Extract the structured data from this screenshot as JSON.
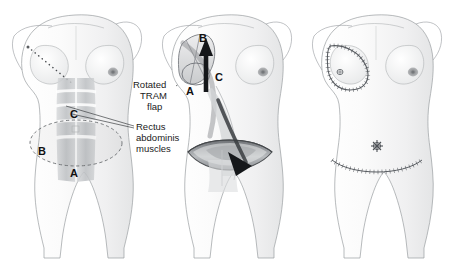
{
  "figure": {
    "background_color": "#ffffff",
    "width": 456,
    "height": 260,
    "panel_count": 3
  },
  "annotations": {
    "rotated_line1": "Rotated",
    "rotated_line2": "TRAM",
    "rotated_line3": "flap",
    "rectus_line1": "Rectus",
    "rectus_line2": "abdominis",
    "rectus_line3": "muscles"
  },
  "markers": {
    "left_a": "A",
    "left_b": "B",
    "left_c": "C",
    "mid_a": "A",
    "mid_b": "B",
    "mid_c": "C"
  },
  "panels": [
    {
      "id": "panel-preop",
      "name": "preoperative-planning",
      "features": [
        "dotted mastectomy incision line on right chest",
        "dashed elliptical abdominal flap outline",
        "shaded rectus abdominis muscle strips",
        "markers A B C"
      ]
    },
    {
      "id": "panel-transfer",
      "name": "flap-rotation-transfer",
      "features": [
        "curved arrow from abdominal donor site to chest",
        "rotated TRAM flap at chest",
        "open lens-shaped donor site defect",
        "markers A B C"
      ]
    },
    {
      "id": "panel-postop",
      "name": "postoperative-result",
      "features": [
        "teardrop suture line on reconstructed breast",
        "reconstructed nipple",
        "starburst umbilicus",
        "curved horizontal abdominal suture line"
      ]
    }
  ],
  "colors": {
    "outline": "#8e9196",
    "skin_shade": "#f2f2f3",
    "muscle_shade": "#c9cbcd",
    "muscle_dark": "#9fa2a6",
    "arrow": "#2a2a2a",
    "suture": "#555a60",
    "areola": "#9a9a9c",
    "dashed": "#6b6e72"
  }
}
